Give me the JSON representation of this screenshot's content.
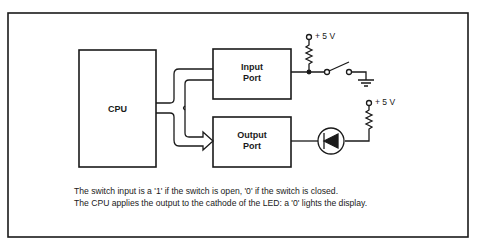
{
  "blocks": {
    "cpu": "CPU",
    "input_port": [
      "Input",
      "Port"
    ],
    "output_port": [
      "Output",
      "Port"
    ]
  },
  "supplies": {
    "switch_pullup": "+ 5 V",
    "led_supply": "+ 5 V"
  },
  "caption": [
    "The switch input is a '1' if the switch is open, '0' if the switch is closed.",
    "The CPU applies the output to the cathode of the LED: a '0' lights the display."
  ],
  "colors": {
    "ink": "#1a1a1a",
    "background": "#ffffff"
  }
}
